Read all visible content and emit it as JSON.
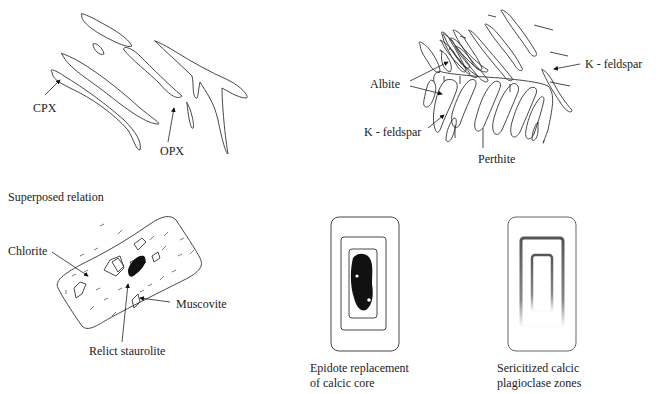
{
  "panels": {
    "pyroxene_exsolution": {
      "labels": {
        "cpx": "CPX",
        "opx": "OPX"
      }
    },
    "perthite": {
      "labels": {
        "albite": "Albite",
        "kfeldspar_right": "K - feldspar",
        "kfeldspar_left": "K - feldspar",
        "perthite": "Perthite"
      }
    },
    "superposed": {
      "heading": "Superposed relation",
      "labels": {
        "chlorite": "Chlorite",
        "muscovite": "Muscovite",
        "relict_staurolite": "Relict staurolite"
      }
    },
    "epidote": {
      "caption_line1": "Epidote replacement",
      "caption_line2": "of calcic core"
    },
    "sericitized": {
      "caption_line1": "Sericitized calcic",
      "caption_line2": "plagioclase zones"
    }
  }
}
